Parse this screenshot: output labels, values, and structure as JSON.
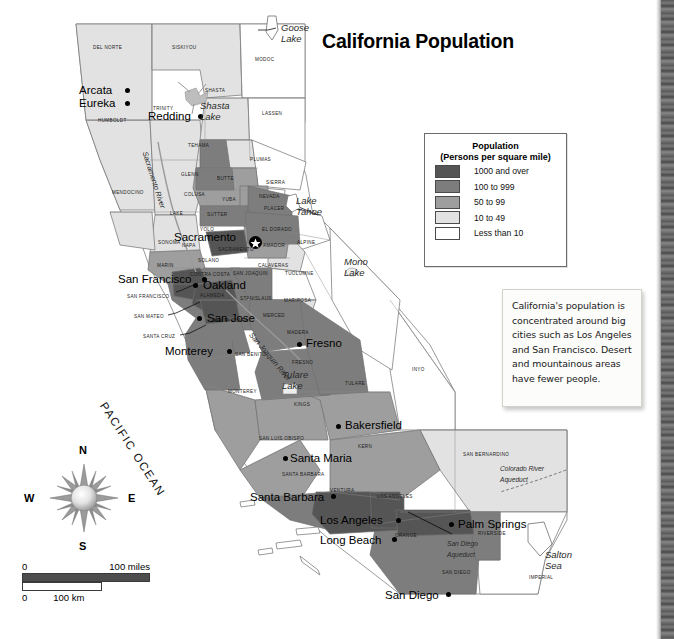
{
  "title": "California Population",
  "legend": {
    "heading_line1": "Population",
    "heading_line2": "(Persons per square mile)",
    "items": [
      {
        "label": "1000 and over",
        "color": "#555555"
      },
      {
        "label": "100 to 999",
        "color": "#7d7d7d"
      },
      {
        "label": "50 to 99",
        "color": "#9e9e9e"
      },
      {
        "label": "10 to 49",
        "color": "#e2e2e2"
      },
      {
        "label": "Less than 10",
        "color": "#ffffff"
      }
    ]
  },
  "note": {
    "text": "California's population is concentrated around big cities such as Los Angeles and San Francisco. Desert and mountainous areas have fewer people."
  },
  "compass": {
    "n": "N",
    "e": "E",
    "s": "S",
    "w": "W"
  },
  "scale": {
    "miles_zero": "0",
    "miles_label": "100 miles",
    "km_zero": "0",
    "km_label": "100 km"
  },
  "ocean": {
    "label": "PACIFIC OCEAN"
  },
  "cities": [
    {
      "name": "Arcata",
      "x": 79,
      "y": 84,
      "dx": 46,
      "dy": 4,
      "capital": false
    },
    {
      "name": "Eureka",
      "x": 79,
      "y": 97,
      "dx": 46,
      "dy": 4,
      "capital": false
    },
    {
      "name": "Redding",
      "x": 148,
      "y": 110,
      "dx": 50,
      "dy": 4,
      "capital": false
    },
    {
      "name": "Sacramento",
      "x": 174,
      "y": 231,
      "dx": 75,
      "dy": 5,
      "capital": true
    },
    {
      "name": "San Francisco",
      "x": 118,
      "y": 273,
      "dx": 84,
      "dy": 4,
      "capital": false
    },
    {
      "name": "Oakland",
      "x": 203,
      "y": 279,
      "dx": -10,
      "dy": 4,
      "capital": false
    },
    {
      "name": "San Jose",
      "x": 207,
      "y": 312,
      "dx": -10,
      "dy": 4,
      "capital": false
    },
    {
      "name": "Monterey",
      "x": 165,
      "y": 345,
      "dx": 62,
      "dy": 4,
      "capital": false
    },
    {
      "name": "Fresno",
      "x": 306,
      "y": 337,
      "dx": -9,
      "dy": 5,
      "capital": false
    },
    {
      "name": "Bakersfield",
      "x": 345,
      "y": 419,
      "dx": -9,
      "dy": 5,
      "capital": false
    },
    {
      "name": "Santa Maria",
      "x": 290,
      "y": 452,
      "dx": -7,
      "dy": 4,
      "capital": false
    },
    {
      "name": "Santa Barbara",
      "x": 250,
      "y": 491,
      "dx": 81,
      "dy": 3,
      "capital": false
    },
    {
      "name": "Los Angeles",
      "x": 320,
      "y": 514,
      "dx": 76,
      "dy": 4,
      "capital": false
    },
    {
      "name": "Long Beach",
      "x": 320,
      "y": 534,
      "dx": 72,
      "dy": 3,
      "capital": false
    },
    {
      "name": "San Diego",
      "x": 385,
      "y": 589,
      "dx": 61,
      "dy": 3,
      "capital": false
    },
    {
      "name": "Palm Springs",
      "x": 458,
      "y": 518,
      "dx": -9,
      "dy": 4,
      "capital": false
    }
  ],
  "water_features": [
    {
      "name": "Goose Lake",
      "x": 281,
      "y": 22,
      "size": "lg"
    },
    {
      "name": "Shasta Lake",
      "x": 200,
      "y": 100,
      "size": "lg"
    },
    {
      "name": "Lake Tahoe",
      "x": 296,
      "y": 195,
      "size": "lg"
    },
    {
      "name": "Mono Lake",
      "x": 344,
      "y": 256,
      "size": "lg"
    },
    {
      "name": "Tulare Lake",
      "x": 282,
      "y": 369,
      "size": "lg"
    },
    {
      "name": "Salton Sea",
      "x": 545,
      "y": 549,
      "size": "lg"
    },
    {
      "name": "Sacramento River",
      "x": 150,
      "y": 150,
      "size": "rot"
    },
    {
      "name": "San Joaquin River",
      "x": 255,
      "y": 330,
      "size": "rot"
    },
    {
      "name": "Colorado River Aqueduct",
      "x": 500,
      "y": 463,
      "size": "sm"
    },
    {
      "name": "San Diego Aqueduct",
      "x": 447,
      "y": 538,
      "size": "sm"
    }
  ],
  "counties": [
    {
      "name": "DEL NORTE",
      "x": 93,
      "y": 45
    },
    {
      "name": "SISKIYOU",
      "x": 172,
      "y": 45
    },
    {
      "name": "MODOC",
      "x": 255,
      "y": 57
    },
    {
      "name": "HUMBOLDT",
      "x": 98,
      "y": 118
    },
    {
      "name": "TRINITY",
      "x": 153,
      "y": 106
    },
    {
      "name": "SHASTA",
      "x": 205,
      "y": 88
    },
    {
      "name": "LASSEN",
      "x": 262,
      "y": 111
    },
    {
      "name": "TEHAMA",
      "x": 188,
      "y": 143
    },
    {
      "name": "PLUMAS",
      "x": 250,
      "y": 157
    },
    {
      "name": "MENDOCINO",
      "x": 112,
      "y": 190
    },
    {
      "name": "GLENN",
      "x": 181,
      "y": 172
    },
    {
      "name": "BUTTE",
      "x": 217,
      "y": 176
    },
    {
      "name": "SIERRA",
      "x": 266,
      "y": 180
    },
    {
      "name": "COLUSA",
      "x": 184,
      "y": 192
    },
    {
      "name": "YUBA",
      "x": 222,
      "y": 197
    },
    {
      "name": "NEVADA",
      "x": 259,
      "y": 194
    },
    {
      "name": "LAKE",
      "x": 170,
      "y": 211
    },
    {
      "name": "SUTTER",
      "x": 207,
      "y": 212
    },
    {
      "name": "PLACER",
      "x": 264,
      "y": 206
    },
    {
      "name": "YOLO",
      "x": 200,
      "y": 227
    },
    {
      "name": "EL DORADO",
      "x": 262,
      "y": 227
    },
    {
      "name": "SONOMA",
      "x": 158,
      "y": 240
    },
    {
      "name": "NAPA",
      "x": 182,
      "y": 243
    },
    {
      "name": "SACRAMENTO",
      "x": 218,
      "y": 247
    },
    {
      "name": "AMADOR",
      "x": 263,
      "y": 243
    },
    {
      "name": "ALPINE",
      "x": 297,
      "y": 240
    },
    {
      "name": "SOLANO",
      "x": 198,
      "y": 258
    },
    {
      "name": "CALAVERAS",
      "x": 258,
      "y": 263
    },
    {
      "name": "MARIN",
      "x": 157,
      "y": 263
    },
    {
      "name": "CONTRA COSTA",
      "x": 190,
      "y": 272
    },
    {
      "name": "SAN JOAQUIN",
      "x": 233,
      "y": 271
    },
    {
      "name": "TUOLUMNE",
      "x": 285,
      "y": 271
    },
    {
      "name": "SAN FRANCISCO",
      "x": 127,
      "y": 294
    },
    {
      "name": "ALAMEDA",
      "x": 200,
      "y": 293
    },
    {
      "name": "STANISLAUS",
      "x": 240,
      "y": 296
    },
    {
      "name": "MARIPOSA",
      "x": 284,
      "y": 298
    },
    {
      "name": "SAN MATEO",
      "x": 134,
      "y": 314
    },
    {
      "name": "SANTA CLARA",
      "x": 213,
      "y": 318
    },
    {
      "name": "MERCED",
      "x": 263,
      "y": 313
    },
    {
      "name": "MADERA",
      "x": 287,
      "y": 330
    },
    {
      "name": "SANTA CRUZ",
      "x": 143,
      "y": 334
    },
    {
      "name": "SAN BENITO",
      "x": 235,
      "y": 352
    },
    {
      "name": "FRESNO",
      "x": 292,
      "y": 360
    },
    {
      "name": "INYO",
      "x": 412,
      "y": 367
    },
    {
      "name": "MONTEREY",
      "x": 228,
      "y": 389
    },
    {
      "name": "TULARE",
      "x": 345,
      "y": 381
    },
    {
      "name": "KINGS",
      "x": 294,
      "y": 402
    },
    {
      "name": "SAN LUIS OBISPO",
      "x": 259,
      "y": 436
    },
    {
      "name": "KERN",
      "x": 358,
      "y": 444
    },
    {
      "name": "SAN BERNARDINO",
      "x": 463,
      "y": 452
    },
    {
      "name": "SANTA BARBARA",
      "x": 282,
      "y": 472
    },
    {
      "name": "VENTURA",
      "x": 330,
      "y": 488
    },
    {
      "name": "LOS ANGELES",
      "x": 377,
      "y": 494
    },
    {
      "name": "ORANGE",
      "x": 395,
      "y": 533
    },
    {
      "name": "RIVERSIDE",
      "x": 478,
      "y": 531
    },
    {
      "name": "SAN DIEGO",
      "x": 442,
      "y": 570
    },
    {
      "name": "IMPERIAL",
      "x": 529,
      "y": 575
    }
  ]
}
